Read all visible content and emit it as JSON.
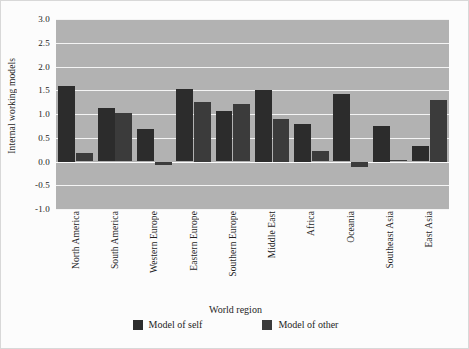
{
  "chart_data": {
    "type": "bar",
    "title": "",
    "xlabel": "World region",
    "ylabel": "Internal working models",
    "ylim": [
      -1.0,
      3.0
    ],
    "yticks": [
      "3.0",
      "2.5",
      "2.0",
      "1.5",
      "1.0",
      "0.5",
      "0.0",
      "-0.5",
      "-1.0"
    ],
    "ytick_values": [
      3.0,
      2.5,
      2.0,
      1.5,
      1.0,
      0.5,
      0.0,
      -0.5,
      -1.0
    ],
    "grid": true,
    "legend_position": "bottom",
    "categories": [
      "North America",
      "South America",
      "Western Europe",
      "Eastern Europe",
      "Southern Europe",
      "Middle East",
      "Africa",
      "Oceania",
      "Southeast Asia",
      "East Asia"
    ],
    "series": [
      {
        "name": "Model of self",
        "color": "#2c2c2c",
        "values": [
          1.6,
          1.12,
          0.68,
          1.52,
          1.07,
          1.5,
          0.8,
          1.42,
          0.75,
          0.32
        ]
      },
      {
        "name": "Model of other",
        "color": "#3b3b3b",
        "values": [
          0.18,
          1.03,
          -0.08,
          1.25,
          1.22,
          0.9,
          0.22,
          -0.12,
          0.03,
          1.3
        ]
      }
    ]
  },
  "legend": {
    "entries": [
      {
        "label": "Model of self",
        "color": "#2c2c2c"
      },
      {
        "label": "Model of other",
        "color": "#3b3b3b"
      }
    ]
  },
  "style": {
    "plot_background": "#b2b2b2",
    "gridline_color": "#f4f4f4",
    "figure_background": "#fcfcfc"
  }
}
